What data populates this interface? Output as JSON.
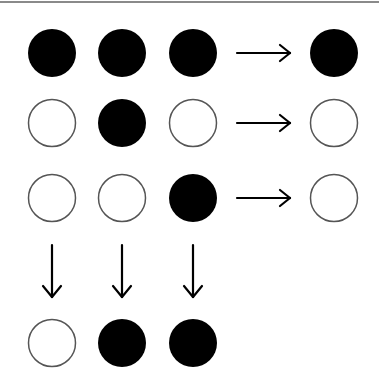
{
  "diagram": {
    "circle_radius": 24,
    "filled_color": "#000000",
    "empty_stroke": "#555555",
    "columns_x": [
      52,
      122,
      193,
      334
    ],
    "rows_y": [
      53,
      123,
      198,
      343
    ],
    "grid": [
      [
        1,
        1,
        1
      ],
      [
        0,
        1,
        0
      ],
      [
        0,
        0,
        1
      ]
    ],
    "row_results": [
      1,
      0,
      0
    ],
    "column_results": [
      0,
      1,
      1
    ],
    "right_arrow": {
      "x1": 237,
      "x2": 290
    },
    "down_arrow": {
      "y1": 245,
      "y2": 297
    }
  }
}
